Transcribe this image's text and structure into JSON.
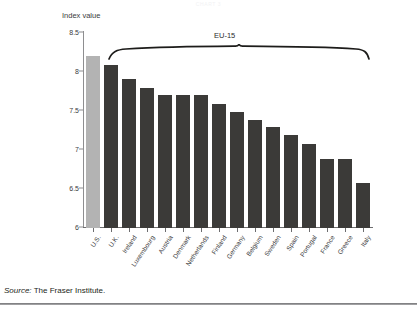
{
  "page": {
    "running_head": "CHART 3",
    "source_prefix": "Source:",
    "source_text": "The Fraser Institute."
  },
  "chart_data": {
    "type": "bar",
    "title": "",
    "xlabel": "",
    "ylabel": "Index value",
    "ylim": [
      6,
      8.5
    ],
    "ytick_labels": [
      "8.5",
      "8",
      "7.5",
      "7",
      "6.5",
      "6"
    ],
    "ytick_values": [
      8.5,
      8,
      7.5,
      7,
      6.5,
      6
    ],
    "grid": false,
    "legend": "none",
    "categories": [
      "U.S.",
      "U.K.",
      "Ireland",
      "Luxembourg",
      "Austria",
      "Denmark",
      "Netherlands",
      "Finland",
      "Germany",
      "Belgium",
      "Sweden",
      "Spain",
      "Portugal",
      "France",
      "Greece",
      "Italy"
    ],
    "values": [
      8.2,
      8.09,
      7.91,
      7.79,
      7.7,
      7.7,
      7.7,
      7.59,
      7.49,
      7.39,
      7.29,
      7.19,
      7.08,
      6.89,
      6.88,
      6.58
    ],
    "bar_colors": [
      "#b3b3b3",
      "#3b3a38",
      "#3b3a38",
      "#3b3a38",
      "#3b3a38",
      "#3b3a38",
      "#3b3a38",
      "#3b3a38",
      "#3b3a38",
      "#3b3a38",
      "#3b3a38",
      "#3b3a38",
      "#3b3a38",
      "#3b3a38",
      "#3b3a38",
      "#3b3a38"
    ],
    "annotations": [
      {
        "label": "EU-15",
        "type": "brace",
        "spans_from": "U.K.",
        "spans_to": "Italy"
      }
    ]
  },
  "colors": {
    "highlight_bar": "#b3b3b3",
    "series_bar": "#3b3a38",
    "axis": "#8e8e90",
    "text": "#3b3b3d"
  }
}
